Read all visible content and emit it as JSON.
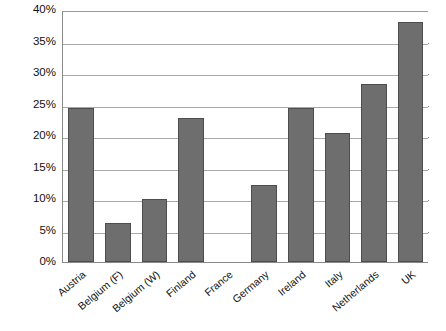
{
  "chart_data": {
    "type": "bar",
    "title": "",
    "subtitle": "",
    "xlabel": "",
    "ylabel": "",
    "categories": [
      "Austria",
      "Belgium (F)",
      "Belgium (W)",
      "Finland",
      "France",
      "Germany",
      "Ireland",
      "Italy",
      "Netherlands",
      "UK"
    ],
    "values": [
      24.4,
      6.2,
      10.0,
      22.9,
      0.0,
      12.2,
      24.5,
      20.4,
      28.2,
      38.1
    ],
    "series": [
      {
        "name": "",
        "values": [
          24.4,
          6.2,
          10.0,
          22.9,
          0.0,
          12.2,
          24.5,
          20.4,
          28.2,
          38.1
        ]
      }
    ],
    "ylim": [
      0,
      40
    ],
    "ytick_values": [
      0,
      5,
      10,
      15,
      20,
      25,
      30,
      35,
      40
    ],
    "ytick_labels": [
      "0%",
      "5%",
      "10%",
      "15%",
      "20%",
      "25%",
      "30%",
      "35%",
      "40%"
    ],
    "grid": true,
    "grid_axis": "y",
    "legend": false,
    "legend_position": "none",
    "bar_color": "#6e6e6e",
    "bar_border_color": "#4d4d4d",
    "grid_color": "#a8a8a8",
    "axis_color": "#8a8a8a",
    "annotations": []
  }
}
